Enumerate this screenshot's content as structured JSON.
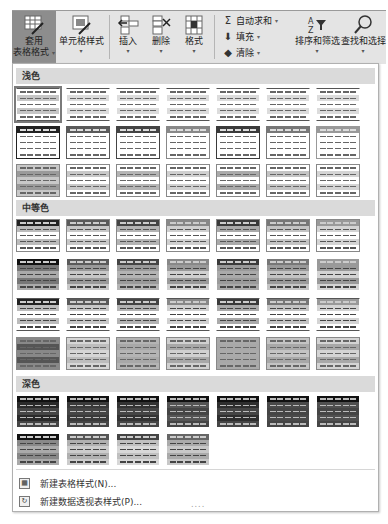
{
  "ribbon": {
    "buttons": [
      {
        "id": "format-as-table",
        "line1": "套用",
        "line2": "表格格式",
        "caret": "▾",
        "active": true
      },
      {
        "id": "cell-styles",
        "line1": "",
        "line2": "单元格样式",
        "caret": "▾"
      },
      {
        "id": "insert",
        "line1": "",
        "line2": "插入",
        "caret": "▾"
      },
      {
        "id": "delete",
        "line1": "",
        "line2": "删除",
        "caret": "▾"
      },
      {
        "id": "format",
        "line1": "",
        "line2": "格式",
        "caret": "▾"
      },
      {
        "id": "sort-filter",
        "line1": "",
        "line2": "排序和筛选",
        "caret": "▾"
      },
      {
        "id": "find-select",
        "line1": "",
        "line2": "查找和选择",
        "caret": "▾"
      }
    ],
    "editing": [
      {
        "icon": "Σ",
        "label": "自动求和",
        "caret": "▾"
      },
      {
        "icon": "⬇",
        "label": "填充",
        "caret": "▾"
      },
      {
        "icon": "◆",
        "label": "清除",
        "caret": "▾"
      }
    ]
  },
  "gallery": {
    "sections": [
      {
        "title": "浅色"
      },
      {
        "title": "中等色"
      },
      {
        "title": "深色"
      }
    ]
  },
  "footer": {
    "new_table_style": "新建表格样式(N)...",
    "new_pivot_style": "新建数据透视表样式(P)..."
  },
  "grip": "....",
  "colors": {
    "ribbon_bg": "#e4e4e4",
    "active_button": "#8d8d8d",
    "section_header": "#dadada"
  }
}
